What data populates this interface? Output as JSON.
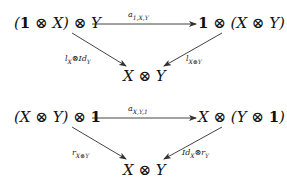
{
  "diagram1": {
    "top_left": "(1 ⊗ X) ⊗ Y",
    "top_right": "1 ⊗ (X ⊗ Y)",
    "bottom": "X ⊗ Y",
    "top_arrow_label": "a1,X,Y",
    "left_arrow_label": "lX⊗IdY",
    "right_arrow_label": "lX⊗Y"
  },
  "diagram2": {
    "top_left": "(X ⊗ Y) ⊗ 1",
    "top_right": "X ⊗ (Y ⊗ 1)",
    "bottom": "X ⊗ Y",
    "top_arrow_label": "aX,Y,1",
    "left_arrow_label": "rX⊗Y",
    "right_arrow_label": "IdX⊗rY"
  }
}
